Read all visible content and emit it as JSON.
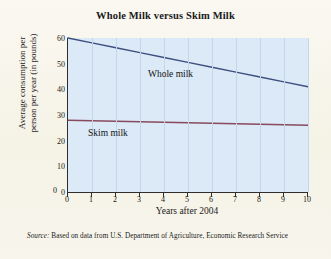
{
  "chart_data": {
    "type": "line",
    "title": "Whole Milk versus Skim Milk",
    "xlabel": "Years after 2004",
    "ylabel": "Average consumption per person per year (in pounds)",
    "ylabel_line1": "Average consumption per",
    "ylabel_line2": "person per year (in pounds)",
    "x": [
      0,
      1,
      2,
      3,
      4,
      5,
      6,
      7,
      8,
      9,
      10
    ],
    "xticks": [
      "0",
      "1",
      "2",
      "3",
      "4",
      "5",
      "6",
      "7",
      "8",
      "9",
      "10"
    ],
    "yticks": [
      "0",
      "10",
      "20",
      "30",
      "40",
      "50",
      "60"
    ],
    "ytick_values": [
      0,
      10,
      20,
      30,
      40,
      50,
      60
    ],
    "xlim": [
      0,
      10
    ],
    "ylim": [
      0,
      60
    ],
    "grid": "vertical-only",
    "legend": "inline-labels",
    "series": [
      {
        "name": "Whole milk",
        "label": "Whole milk",
        "color": "#3c4f80",
        "values": [
          60.0,
          58.1,
          56.2,
          54.3,
          52.4,
          50.5,
          48.6,
          46.7,
          44.8,
          42.9,
          41.0
        ]
      },
      {
        "name": "Skim milk",
        "label": "Skim milk",
        "color": "#8a4a5e",
        "values": [
          28.0,
          27.8,
          27.6,
          27.4,
          27.2,
          27.0,
          26.8,
          26.6,
          26.4,
          26.2,
          26.0
        ]
      }
    ],
    "origin_label": "0",
    "source_prefix": "Source:",
    "source_text": "Based on data from U.S. Department of Agriculture, Economic Research Service",
    "colors": {
      "plot_background": "#dce9f6",
      "page_background": "#f7f5ec",
      "gridline": "#c3d6ea",
      "axis": "#2e2e2e",
      "whole_milk": "#3c4f80",
      "skim_milk": "#8a4a5e"
    }
  }
}
